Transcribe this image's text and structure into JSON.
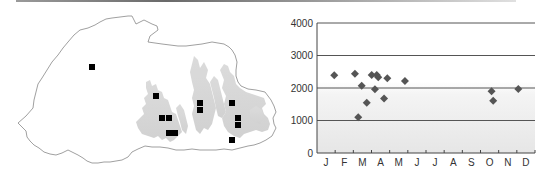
{
  "map": {
    "outline_color": "#777777",
    "relief_color": "#d2d2d2",
    "marker_color": "#000000",
    "markers": [
      {
        "x": 92,
        "y": 67
      },
      {
        "x": 156,
        "y": 96
      },
      {
        "x": 162,
        "y": 118
      },
      {
        "x": 169,
        "y": 118
      },
      {
        "x": 169,
        "y": 133
      },
      {
        "x": 175,
        "y": 133
      },
      {
        "x": 200,
        "y": 103
      },
      {
        "x": 200,
        "y": 110
      },
      {
        "x": 232,
        "y": 103
      },
      {
        "x": 238,
        "y": 118
      },
      {
        "x": 238,
        "y": 125
      },
      {
        "x": 232,
        "y": 140
      }
    ]
  },
  "chart_data": {
    "type": "scatter",
    "title": "",
    "xlabel": "",
    "ylabel": "",
    "categories": [
      "J",
      "F",
      "M",
      "A",
      "M",
      "J",
      "J",
      "A",
      "S",
      "O",
      "N",
      "D"
    ],
    "y_ticks": [
      "0",
      "1000",
      "2000",
      "3000",
      "4000"
    ],
    "ylim": [
      0,
      4000
    ],
    "grid": true,
    "marker": "diamond",
    "marker_color": "#555555",
    "gridline_color": "#555555",
    "series": [
      {
        "name": "records",
        "points": [
          {
            "month": 0.95,
            "elevation": 2390
          },
          {
            "month": 2.09,
            "elevation": 2440
          },
          {
            "month": 2.27,
            "elevation": 1100
          },
          {
            "month": 2.46,
            "elevation": 2070
          },
          {
            "month": 2.74,
            "elevation": 1550
          },
          {
            "month": 3.01,
            "elevation": 2400
          },
          {
            "month": 3.19,
            "elevation": 1960
          },
          {
            "month": 3.29,
            "elevation": 2400
          },
          {
            "month": 3.37,
            "elevation": 2330
          },
          {
            "month": 3.69,
            "elevation": 1680
          },
          {
            "month": 3.87,
            "elevation": 2300
          },
          {
            "month": 4.84,
            "elevation": 2215
          },
          {
            "month": 9.61,
            "elevation": 1900
          },
          {
            "month": 9.7,
            "elevation": 1610
          },
          {
            "month": 11.08,
            "elevation": 1970
          }
        ]
      }
    ]
  }
}
